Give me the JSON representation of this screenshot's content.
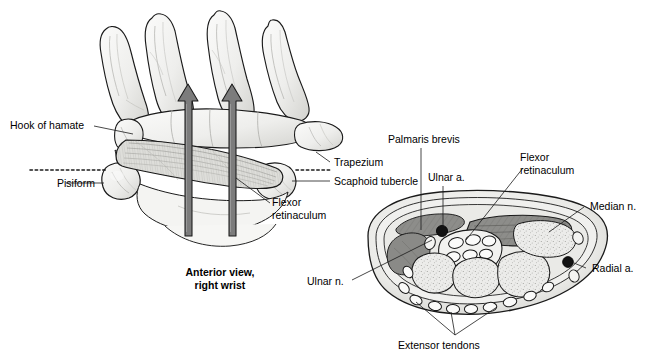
{
  "figure": {
    "title_caption": "Anterior view,\nright wrist",
    "left_panel": {
      "name": "anterior-view-right-wrist",
      "labels": [
        {
          "key": "hook_of_hamate",
          "text": "Hook of hamate"
        },
        {
          "key": "pisiform",
          "text": "Pisiform"
        },
        {
          "key": "trapezium",
          "text": "Trapezium"
        },
        {
          "key": "scaphoid_tubercle",
          "text": "Scaphoid tubercle"
        },
        {
          "key": "flexor_retinaculum",
          "text": "Flexor\nretinaculum"
        }
      ]
    },
    "right_panel": {
      "name": "carpal-tunnel-cross-section",
      "labels": [
        {
          "key": "palmaris_brevis",
          "text": "Palmaris brevis"
        },
        {
          "key": "ulnar_a",
          "text": "Ulnar a."
        },
        {
          "key": "flexor_retinaculum",
          "text": "Flexor\nretinaculum"
        },
        {
          "key": "median_n",
          "text": "Median n."
        },
        {
          "key": "radial_a",
          "text": "Radial a."
        },
        {
          "key": "ulnar_n",
          "text": "Ulnar n."
        },
        {
          "key": "extensor_tendons",
          "text": "Extensor tendons"
        }
      ]
    },
    "colors": {
      "ink": "#1a1a1a",
      "bone_fill": "#f2f2f0",
      "bone_shade": "#d6d6d2",
      "arrow_fill": "#7c7c7c",
      "muscle_dark": "#6e6e6e",
      "retinaculum_band": "#8e8e8e",
      "soft_tissue": "#e8e8e6",
      "vessel_dark": "#111111",
      "background": "#ffffff"
    }
  }
}
